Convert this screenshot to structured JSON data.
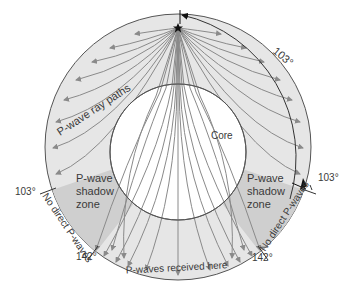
{
  "title": "P-wave shadow zone",
  "labels": {
    "ray_paths": "P-wave ray paths",
    "core": "Core",
    "shadow_left": [
      "P-wave",
      "shadow",
      "zone"
    ],
    "shadow_right": [
      "P-wave",
      "shadow",
      "zone"
    ],
    "no_direct_left": "No direct P-waves",
    "no_direct_right": "No direct P-waves",
    "received": "P-waves received here",
    "angle_top": "103°",
    "angle_left_103": "103°",
    "angle_right_103": "103°",
    "angle_left_142": "142°",
    "angle_right_142": "142°"
  },
  "icons": {
    "epicenter": "star-icon"
  },
  "colors": {
    "mantle": "#e6e6e6",
    "shadow_zone": "#cfcfcf",
    "core": "#ffffff",
    "rays": "#8a8a8a",
    "outline": "#555555",
    "text": "#3a3a3a"
  }
}
